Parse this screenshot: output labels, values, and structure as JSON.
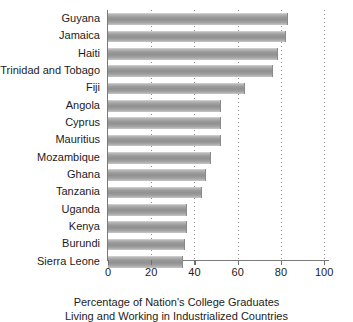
{
  "chart_data": {
    "type": "bar",
    "orientation": "horizontal",
    "title": "",
    "xlabel": "Percentage of Nation's College Graduates Living and Working in Industrialized Countries",
    "ylabel": "",
    "xlim": [
      0,
      105
    ],
    "xticks": [
      0,
      20,
      40,
      60,
      80,
      100
    ],
    "xtick_labels": [
      "0",
      "20",
      "40",
      "60",
      "80",
      "100"
    ],
    "grid": true,
    "grid_axis": "x",
    "grid_style": "dotted",
    "legend": "none",
    "categories": [
      "Guyana",
      "Jamaica",
      "Haiti",
      "Trinidad and Tobago",
      "Fiji",
      "Angola",
      "Cyprus",
      "Mauritius",
      "Mozambique",
      "Ghana",
      "Tanzania",
      "Uganda",
      "Kenya",
      "Burundi",
      "Sierra Leone"
    ],
    "values": [
      83,
      82,
      78,
      76,
      63,
      52,
      52,
      52,
      47,
      45,
      43,
      36,
      36,
      35,
      34
    ],
    "bar_color": "#9a9a9a",
    "bar_gradient": [
      "#d8d8d8",
      "#909090",
      "#c6c6c6"
    ],
    "axis_color": "#7a7a7a",
    "text_color": "#1c1c1c"
  },
  "axis_title": {
    "line1": "Percentage of Nation's College Graduates",
    "line2": "Living and Working in Industrialized Countries"
  }
}
